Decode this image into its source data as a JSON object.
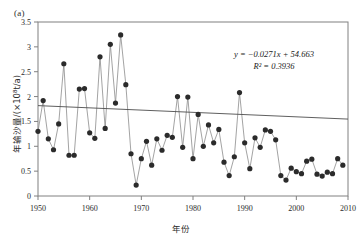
{
  "figure": {
    "panel_label": "(a)",
    "y_axis_title": "年输沙量/(×10⁸t/a)",
    "x_axis_title": "年份",
    "equation_line1": "y = −0.0271x + 54.663",
    "equation_line2": "R² = 0.3936",
    "marker_color": "#2b2b2b",
    "line_color": "#8c8c8c",
    "trend_color": "#4d4d4d",
    "frame_color": "#808080"
  },
  "chart_data": {
    "type": "line",
    "title": "",
    "subtitle": "",
    "xlabel": "年份",
    "ylabel": "年输沙量/(×10⁸t/a)",
    "xlim": [
      1950,
      2010
    ],
    "ylim": [
      0,
      3.5
    ],
    "xticks": [
      1950,
      1960,
      1970,
      1980,
      1990,
      2000,
      2010
    ],
    "yticks": [
      0,
      0.5,
      1,
      1.5,
      2,
      2.5,
      3,
      3.5
    ],
    "grid": false,
    "legend": null,
    "markers": "filled-circle",
    "annotations": [
      {
        "text": "(a)",
        "position": "top-left-outside"
      },
      {
        "text": "y = −0.0271x + 54.663",
        "position": "upper-right"
      },
      {
        "text": "R² = 0.3936",
        "position": "upper-right"
      }
    ],
    "trendline": {
      "type": "linear",
      "slope": -0.0271,
      "intercept": 54.663,
      "r_squared": 0.3936,
      "equation": "y = −0.0271x + 54.663",
      "x_start": 1950,
      "x_end": 2010,
      "y_start": 1.818,
      "y_end": 1.547
    },
    "series": [
      {
        "name": "年输沙量",
        "x": [
          1950,
          1951,
          1952,
          1953,
          1954,
          1955,
          1956,
          1957,
          1958,
          1959,
          1960,
          1961,
          1962,
          1963,
          1964,
          1965,
          1966,
          1967,
          1968,
          1969,
          1970,
          1971,
          1972,
          1973,
          1974,
          1975,
          1976,
          1977,
          1978,
          1979,
          1980,
          1981,
          1982,
          1983,
          1984,
          1985,
          1986,
          1987,
          1988,
          1989,
          1990,
          1991,
          1992,
          1993,
          1994,
          1995,
          1996,
          1997,
          1998,
          1999,
          2000,
          2001,
          2002,
          2003,
          2004,
          2005,
          2006,
          2007,
          2008,
          2009
        ],
        "values": [
          1.3,
          1.92,
          1.15,
          0.93,
          1.45,
          2.66,
          0.82,
          0.82,
          2.15,
          2.16,
          1.27,
          1.16,
          2.8,
          1.36,
          3.05,
          1.87,
          3.24,
          2.24,
          0.85,
          0.22,
          0.75,
          1.1,
          0.62,
          1.15,
          0.92,
          1.22,
          1.18,
          2.0,
          0.98,
          1.99,
          0.75,
          1.64,
          1.0,
          1.43,
          1.07,
          1.34,
          0.68,
          0.41,
          0.79,
          2.08,
          1.07,
          0.55,
          1.17,
          0.98,
          1.33,
          1.3,
          1.13,
          0.41,
          0.32,
          0.56,
          0.49,
          0.45,
          0.7,
          0.74,
          0.44,
          0.4,
          0.48,
          0.45,
          0.75,
          0.62
        ]
      }
    ]
  }
}
